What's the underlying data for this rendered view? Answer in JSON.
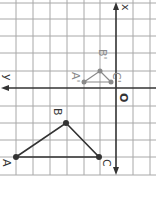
{
  "figure": {
    "axis_labels": {
      "vertical_axis": "x",
      "horizontal_axis": "y",
      "origin": "O"
    },
    "grid": {
      "x_lines": [
        16,
        33,
        50,
        67,
        84,
        100,
        116,
        133,
        150
      ],
      "y_lines": [
        3,
        19,
        36,
        53,
        71,
        88,
        106,
        123,
        140,
        157,
        175
      ],
      "color": "#a8a8a8"
    },
    "axes": {
      "color": "#333333",
      "vertical_x": 116,
      "horizontal_y": 88
    },
    "triangle_original": {
      "color": "#333333",
      "points": [
        {
          "label": "A",
          "x": 16,
          "y": 157
        },
        {
          "label": "B",
          "x": 66,
          "y": 123
        },
        {
          "label": "C",
          "x": 99,
          "y": 157
        }
      ]
    },
    "triangle_image": {
      "color": "#8a8a8a",
      "points": [
        {
          "label": "A'",
          "x": 84,
          "y": 82
        },
        {
          "label": "B'",
          "x": 100,
          "y": 71
        },
        {
          "label": "C'",
          "x": 111,
          "y": 82
        }
      ]
    }
  }
}
